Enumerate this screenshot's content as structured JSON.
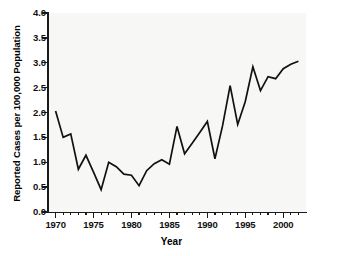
{
  "chart_data": {
    "type": "line",
    "title": "",
    "xlabel": "Year",
    "ylabel": "Reported Cases per 100,000 Population",
    "xlim": [
      1969,
      2003
    ],
    "ylim": [
      0.0,
      4.0
    ],
    "grid": false,
    "legend": null,
    "line_color": "#111111",
    "background_color": "#f7f7f6",
    "y_ticks": [
      "0.0",
      "0.5",
      "1.0",
      "1.5",
      "2.0",
      "2.5",
      "3.0",
      "3.5",
      "4.0"
    ],
    "y_tick_values": [
      0.0,
      0.5,
      1.0,
      1.5,
      2.0,
      2.5,
      3.0,
      3.5,
      4.0
    ],
    "x_ticks": [
      "1970",
      "1975",
      "1980",
      "1985",
      "1990",
      "1995",
      "2000"
    ],
    "x_tick_values": [
      1970,
      1975,
      1980,
      1985,
      1990,
      1995,
      2000
    ],
    "x_minor_tick_interval": 1,
    "x": [
      1970,
      1971,
      1972,
      1973,
      1974,
      1975,
      1976,
      1977,
      1978,
      1979,
      1980,
      1981,
      1982,
      1983,
      1984,
      1985,
      1986,
      1987,
      1988,
      1989,
      1990,
      1991,
      1992,
      1993,
      1994,
      1995,
      1996,
      1997,
      1998,
      1999,
      2000,
      2001,
      2002
    ],
    "values": [
      2.03,
      1.5,
      1.57,
      0.86,
      1.14,
      0.8,
      0.45,
      1.0,
      0.91,
      0.76,
      0.74,
      0.53,
      0.83,
      0.97,
      1.05,
      0.96,
      1.72,
      1.17,
      1.38,
      1.6,
      1.82,
      1.07,
      1.73,
      2.54,
      1.76,
      2.22,
      2.92,
      2.44,
      2.72,
      2.68,
      2.88,
      2.97,
      3.03
    ]
  }
}
